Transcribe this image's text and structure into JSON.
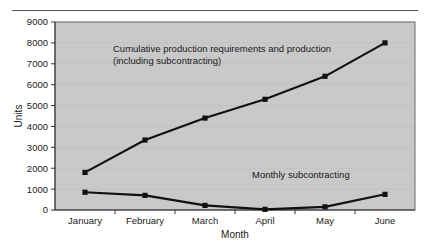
{
  "figure": {
    "background_color": "#ffffff",
    "plot_background_color": "#c9c9c9",
    "line_color": "#111111",
    "rule_color": "#555555",
    "grid_color": "#b3b3b3"
  },
  "chart_data": {
    "type": "line",
    "title": "",
    "xlabel": "Month",
    "ylabel": "Units",
    "categories": [
      "January",
      "February",
      "March",
      "April",
      "May",
      "June"
    ],
    "ytick_labels": [
      "0",
      "1000",
      "2000",
      "3000",
      "4000",
      "5000",
      "6000",
      "7000",
      "8000",
      "9000"
    ],
    "ytick_values": [
      0,
      1000,
      2000,
      3000,
      4000,
      5000,
      6000,
      7000,
      8000,
      9000
    ],
    "ylim": [
      0,
      9000
    ],
    "grid": true,
    "grid_axis": "y",
    "legend_position": "in-plot annotations",
    "series": [
      {
        "name": "Cumulative production requirements and production (including subcontracting)",
        "values": [
          1800,
          3350,
          4400,
          5300,
          6400,
          8000
        ],
        "marker": "filled-square",
        "color": "#111111"
      },
      {
        "name": "Monthly subcontracting",
        "values": [
          850,
          700,
          220,
          30,
          150,
          750
        ],
        "marker": "filled-square",
        "color": "#111111"
      }
    ],
    "annotations": [
      {
        "id": "cumulative-annotation",
        "line1": "Cumulative production requirements and production",
        "line2": "(including subcontracting)",
        "x_px": 113,
        "y_px": 52
      },
      {
        "id": "subcontracting-annotation",
        "line1": "Monthly subcontracting",
        "x_px": 252,
        "y_px": 178
      }
    ]
  }
}
